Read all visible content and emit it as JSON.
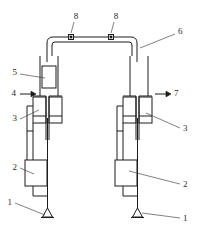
{
  "figure": {
    "line_color": "#1c1c1c",
    "leader_color": "#4a4a4a",
    "background": "#ffffff"
  },
  "callouts": {
    "left_base": "1",
    "right_base": "1",
    "left_pump": "2",
    "right_pump": "2",
    "left_valve_block": "3",
    "right_valve_block": "3",
    "inlet_arrow": "4",
    "piston": "5",
    "manifold": "6",
    "outlet_arrow": "7",
    "port_left": "8",
    "port_right": "8"
  },
  "flow": {
    "inlet_direction": "right",
    "outlet_direction": "right"
  }
}
